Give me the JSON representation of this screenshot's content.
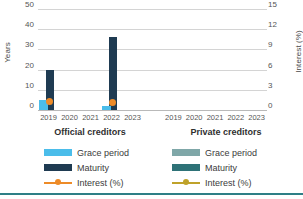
{
  "chart_data": {
    "type": "bar",
    "title": "",
    "subtitle": "",
    "ylabel": "Years",
    "y2label": "Interest (%)",
    "xlabel": "",
    "ylim": [
      0,
      50
    ],
    "y2lim": [
      0,
      15
    ],
    "grid": true,
    "y_ticks": [
      "50",
      "40",
      "30",
      "20",
      "10",
      "0"
    ],
    "y_tick_values": [
      50,
      40,
      30,
      20,
      10,
      0
    ],
    "y2_ticks": [
      "15",
      "12",
      "9",
      "6",
      "3",
      "0"
    ],
    "y2_tick_values": [
      15,
      12,
      9,
      6,
      3,
      0
    ],
    "categories": [
      "2019",
      "2020",
      "2021",
      "2022",
      "2023"
    ],
    "panels": [
      {
        "name": "Official creditors",
        "series": [
          {
            "name": "Grace period",
            "axis": "left",
            "type": "bar",
            "color": "#4bbdea",
            "values": [
              5,
              null,
              null,
              2,
              null
            ]
          },
          {
            "name": "Maturity",
            "axis": "left",
            "type": "bar",
            "color": "#1f3b52",
            "values": [
              20,
              null,
              null,
              36,
              null
            ]
          },
          {
            "name": "Interest (%)",
            "axis": "right",
            "type": "line",
            "color": "#ed8b28",
            "values": [
              1.3,
              null,
              null,
              1.1,
              null
            ]
          }
        ]
      },
      {
        "name": "Private creditors",
        "series": [
          {
            "name": "Grace period",
            "axis": "left",
            "type": "bar",
            "color": "#7fa7a8",
            "values": [
              null,
              null,
              null,
              null,
              null
            ]
          },
          {
            "name": "Maturity",
            "axis": "left",
            "type": "bar",
            "color": "#2e7277",
            "values": [
              null,
              null,
              null,
              null,
              null
            ]
          },
          {
            "name": "Interest (%)",
            "axis": "right",
            "type": "line",
            "color": "#bfa22a",
            "values": [
              null,
              null,
              null,
              null,
              null
            ]
          }
        ]
      }
    ]
  },
  "axes": {
    "left_title": "Years",
    "right_title": "Interest (%)",
    "left_ticks": [
      "50",
      "40",
      "30",
      "20",
      "10",
      "0"
    ],
    "right_ticks": [
      "15",
      "12",
      "9",
      "6",
      "3",
      "0"
    ]
  },
  "panels": {
    "official": {
      "title": "Official creditors",
      "xlabels": [
        "2019",
        "2020",
        "2021",
        "2022",
        "2023"
      ]
    },
    "private": {
      "title": "Private creditors",
      "xlabels": [
        "2019",
        "2020",
        "2021",
        "2022",
        "2023"
      ]
    }
  },
  "legend": {
    "official": [
      {
        "label": "Grace period",
        "color": "#4bbdea",
        "kind": "box"
      },
      {
        "label": "Maturity",
        "color": "#1f3b52",
        "kind": "box"
      },
      {
        "label": "Interest (%)",
        "color": "#ed8b28",
        "kind": "line"
      }
    ],
    "private": [
      {
        "label": "Grace period",
        "color": "#7fa7a8",
        "kind": "box"
      },
      {
        "label": "Maturity",
        "color": "#2e7277",
        "kind": "box"
      },
      {
        "label": "Interest (%)",
        "color": "#bfa22a",
        "kind": "line"
      }
    ]
  },
  "colors": {
    "grid": "#d4d4d4",
    "axis": "#b9b9b9",
    "rule": "#2e7f86",
    "text": "#3d3d3d"
  }
}
